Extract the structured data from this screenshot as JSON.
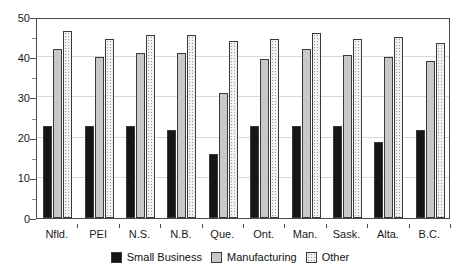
{
  "chart_data": {
    "type": "bar",
    "title": "",
    "subtitle": "",
    "xlabel": "",
    "ylabel": "",
    "ylim": [
      0,
      50
    ],
    "ytick_values": [
      0,
      10,
      20,
      30,
      40,
      50
    ],
    "ytick_labels": [
      "0",
      "10",
      "20",
      "30",
      "40",
      "50"
    ],
    "yminor_values": [
      5,
      15,
      25,
      35,
      45
    ],
    "grid": "horizontal-major",
    "legend_position": "bottom-center",
    "categories": [
      "Nfld.",
      "PEI",
      "N.S.",
      "N.B.",
      "Que.",
      "Ont.",
      "Man.",
      "Sask.",
      "Alta.",
      "B.C."
    ],
    "series": [
      {
        "name": "Small Business",
        "color": "#161616",
        "values": [
          23,
          23,
          23,
          22,
          16,
          23,
          23,
          23,
          19,
          22
        ]
      },
      {
        "name": "Manufacturing",
        "color": "#c8c8c8",
        "values": [
          42,
          40,
          41,
          41,
          31,
          39.5,
          42,
          40.5,
          40,
          39
        ]
      },
      {
        "name": "Other",
        "color": "#f2f2f2",
        "values": [
          46.5,
          44.5,
          45.5,
          45.5,
          44,
          44.5,
          46,
          44.5,
          45,
          43.5
        ]
      }
    ]
  },
  "legend": {
    "entries": [
      {
        "label": "Small Business",
        "swatch": "small-business"
      },
      {
        "label": "Manufacturing",
        "swatch": "manufacturing"
      },
      {
        "label": "Other",
        "swatch": "other"
      }
    ]
  }
}
